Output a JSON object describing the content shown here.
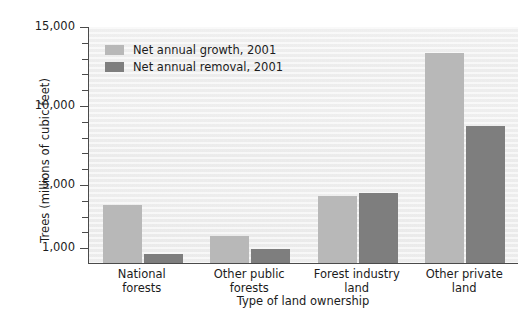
{
  "chart_data": {
    "type": "bar",
    "title": "",
    "subtitle": "",
    "xlabel": "Type of land ownership",
    "ylabel": "Trees (millions of cubic feet)",
    "categories": [
      "National\nforests",
      "Other public\nforests",
      "Forest industry\nland",
      "Other private\nland"
    ],
    "category_lines": [
      [
        "National",
        "forests"
      ],
      [
        "Other public",
        "forests"
      ],
      [
        "Forest industry",
        "land"
      ],
      [
        "Other private",
        "land"
      ]
    ],
    "series": [
      {
        "name": "Net annual growth, 2001",
        "color": "#b8b8b8",
        "values": [
          3700,
          1700,
          4250,
          13300
        ]
      },
      {
        "name": "Net annual removal, 2001",
        "color": "#7e7e7e",
        "values": [
          550,
          900,
          4400,
          8700
        ]
      }
    ],
    "ylim": [
      0,
      15000
    ],
    "ytick_labels": [
      "1,000",
      "5,000",
      "10,000",
      "15,000"
    ],
    "ytick_values": [
      1000,
      5000,
      10000,
      15000
    ],
    "yminor_step": 1000,
    "grid": false,
    "legend_position": "upper-left-inside",
    "units": "millions of cubic feet"
  },
  "legend": {
    "items": [
      {
        "label": "Net annual growth, 2001",
        "swatch": "growth"
      },
      {
        "label": "Net annual removal, 2001",
        "swatch": "removal"
      }
    ]
  },
  "colors": {
    "growth": "#b8b8b8",
    "removal": "#7e7e7e",
    "axis": "#4a4a4a",
    "text": "#1c1c1c",
    "plot_background": "#efefef"
  }
}
